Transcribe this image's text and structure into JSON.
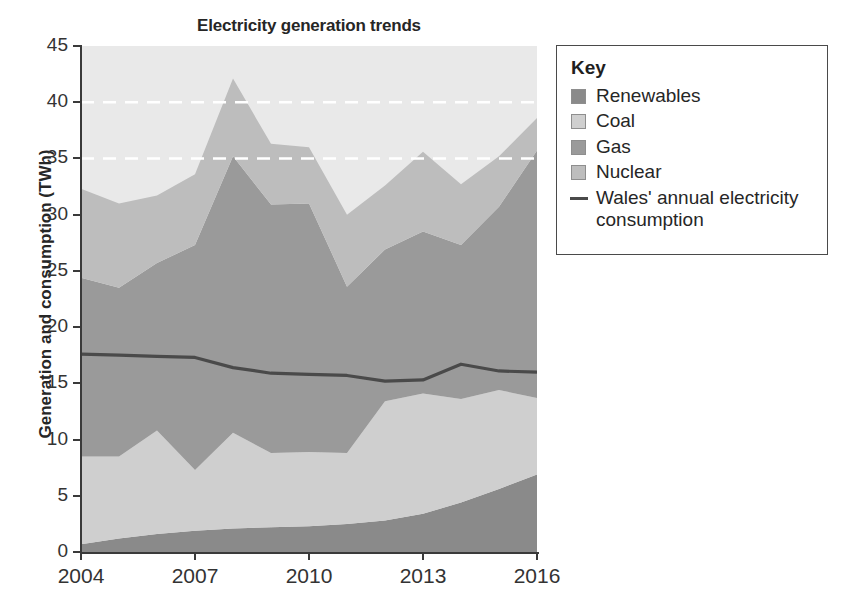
{
  "chart_data": {
    "type": "area",
    "title": "Electricity generation trends",
    "xlabel": "",
    "ylabel": "Generation and consumption (TWh)",
    "stacked": true,
    "grid": "horizontal-dashed-white",
    "gridlines": [
      35,
      40
    ],
    "legend_position": "right",
    "x": [
      2004,
      2005,
      2006,
      2007,
      2008,
      2009,
      2010,
      2011,
      2012,
      2013,
      2014,
      2015,
      2016
    ],
    "xtick_values": [
      2004,
      2007,
      2010,
      2013,
      2016
    ],
    "xtick_labels": [
      "2004",
      "2007",
      "2010",
      "2013",
      "2016"
    ],
    "ytick_values": [
      0,
      5,
      10,
      15,
      20,
      25,
      30,
      35,
      40,
      45
    ],
    "ytick_labels": [
      "0",
      "5",
      "10",
      "15",
      "20",
      "25",
      "30",
      "35",
      "40",
      "45"
    ],
    "ylim": [
      0,
      45
    ],
    "xlim": [
      2004,
      2016
    ],
    "series": [
      {
        "name": "Renewables",
        "color": "#8a8a8a",
        "values": [
          0.7,
          1.2,
          1.6,
          1.9,
          2.1,
          2.2,
          2.3,
          2.5,
          2.8,
          3.4,
          4.4,
          5.6,
          6.9
        ]
      },
      {
        "name": "Coal",
        "color": "#cfcfcf",
        "values": [
          7.8,
          7.3,
          9.2,
          5.4,
          8.5,
          6.6,
          6.6,
          6.3,
          10.6,
          10.7,
          9.2,
          8.8,
          6.8
        ]
      },
      {
        "name": "Gas",
        "color": "#9a9a9a",
        "values": [
          15.9,
          15.0,
          14.9,
          20.0,
          24.6,
          22.1,
          22.1,
          14.8,
          13.5,
          14.4,
          13.7,
          16.3,
          22.0
        ]
      },
      {
        "name": "Nuclear",
        "color": "#bdbdbd",
        "values": [
          7.9,
          7.5,
          6.0,
          6.3,
          6.9,
          5.4,
          5.0,
          6.4,
          5.7,
          7.1,
          5.4,
          4.5,
          2.9
        ]
      }
    ],
    "line_series": {
      "name": "Wales' annual electricity consumption",
      "color": "#4a4a4a",
      "values": [
        17.6,
        17.5,
        17.4,
        17.3,
        16.4,
        15.9,
        15.8,
        15.7,
        15.2,
        15.3,
        16.7,
        16.1,
        16.0
      ]
    },
    "stack_totals": [
      32.3,
      31.0,
      31.7,
      33.6,
      42.1,
      36.3,
      36.0,
      30.0,
      32.6,
      35.6,
      32.7,
      35.2,
      38.6
    ]
  },
  "legend": {
    "title": "Key",
    "items": [
      {
        "label": "Renewables",
        "marker": "swatch",
        "color": "#8a8a8a"
      },
      {
        "label": "Coal",
        "marker": "swatch",
        "color": "#cfcfcf"
      },
      {
        "label": "Gas",
        "marker": "swatch",
        "color": "#9a9a9a"
      },
      {
        "label": "Nuclear",
        "marker": "swatch",
        "color": "#bdbdbd"
      },
      {
        "label": "Wales' annual electricity consumption",
        "marker": "line",
        "color": "#4a4a4a"
      }
    ]
  },
  "colors": {
    "plot_background": "#e9e9e9",
    "axis": "#3a3a3a",
    "gridline": "#ffffff",
    "text": "#262626",
    "page_background": "#ffffff"
  }
}
